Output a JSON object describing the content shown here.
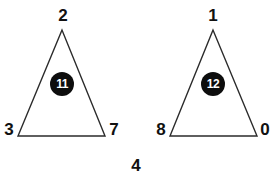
{
  "diagram": {
    "background_color": "#ffffff",
    "stroke_color": "#2b2b2b",
    "label_color": "#111111",
    "badge_fill": "#0d0d0d",
    "badge_text_color": "#ffffff",
    "bottom_label": "4",
    "shapes": [
      {
        "name": "left-triangle",
        "apex_label": "2",
        "bottom_left_label": "3",
        "bottom_right_label": "7",
        "badge_label": "11",
        "points": "62,30 18,136 105,136"
      },
      {
        "name": "right-triangle",
        "apex_label": "1",
        "bottom_left_label": "8",
        "bottom_right_label": "0",
        "badge_label": "12",
        "points": "213,30 170,136 257,136"
      }
    ]
  }
}
